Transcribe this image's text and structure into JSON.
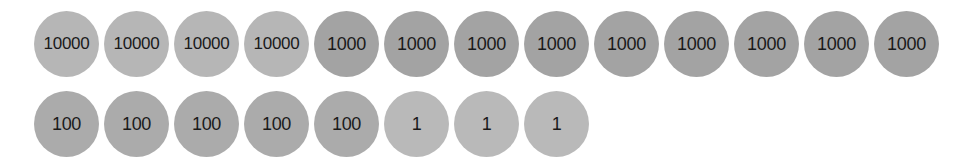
{
  "rows": [
    {
      "coins": [
        {
          "label": "10000",
          "color": "#b6b6b6"
        },
        {
          "label": "10000",
          "color": "#b6b6b6"
        },
        {
          "label": "10000",
          "color": "#b6b6b6"
        },
        {
          "label": "10000",
          "color": "#b6b6b6"
        },
        {
          "label": "1000",
          "color": "#a3a3a3"
        },
        {
          "label": "1000",
          "color": "#a3a3a3"
        },
        {
          "label": "1000",
          "color": "#a3a3a3"
        },
        {
          "label": "1000",
          "color": "#a3a3a3"
        },
        {
          "label": "1000",
          "color": "#a3a3a3"
        },
        {
          "label": "1000",
          "color": "#a3a3a3"
        },
        {
          "label": "1000",
          "color": "#a3a3a3"
        },
        {
          "label": "1000",
          "color": "#a3a3a3"
        },
        {
          "label": "1000",
          "color": "#a3a3a3"
        }
      ]
    },
    {
      "coins": [
        {
          "label": "100",
          "color": "#ababab"
        },
        {
          "label": "100",
          "color": "#ababab"
        },
        {
          "label": "100",
          "color": "#ababab"
        },
        {
          "label": "100",
          "color": "#ababab"
        },
        {
          "label": "100",
          "color": "#ababab"
        },
        {
          "label": "1",
          "color": "#b9b9b9"
        },
        {
          "label": "1",
          "color": "#b9b9b9"
        },
        {
          "label": "1",
          "color": "#b9b9b9"
        }
      ]
    }
  ]
}
